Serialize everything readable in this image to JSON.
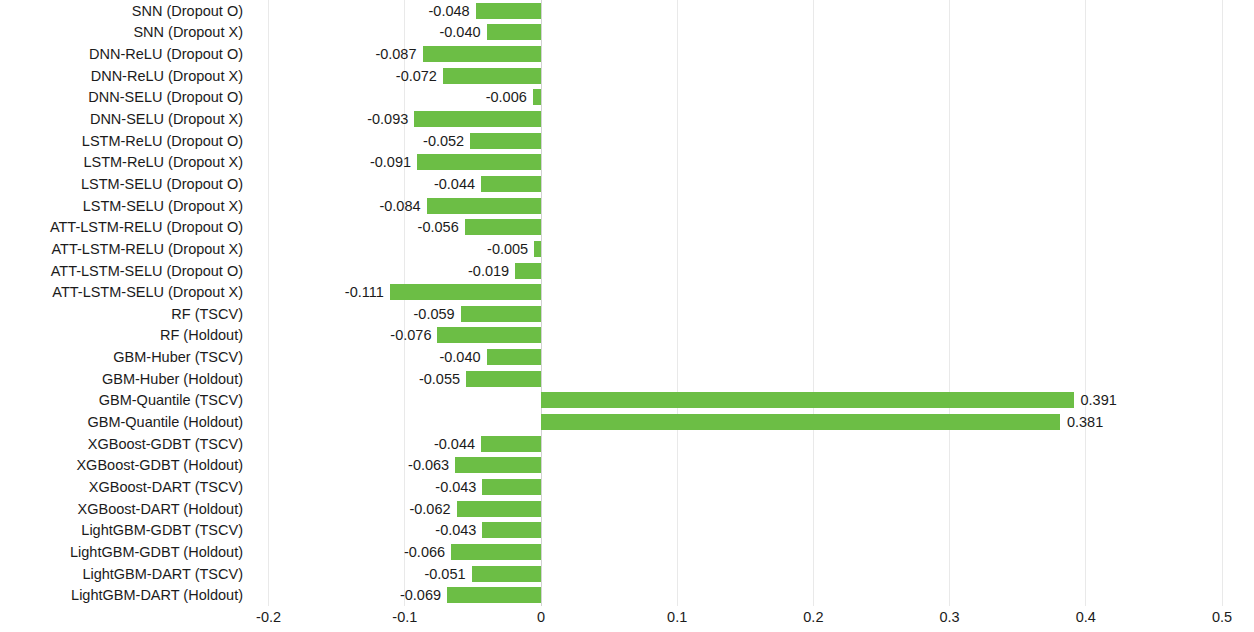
{
  "chart_data": {
    "type": "bar",
    "orientation": "horizontal",
    "title": "",
    "xlabel": "",
    "ylabel": "",
    "xlim": [
      -0.2,
      0.5
    ],
    "xticks": [
      "-0.2",
      "-0.1",
      "0",
      "0.1",
      "0.2",
      "0.3",
      "0.4",
      "0.5"
    ],
    "xtick_values": [
      -0.2,
      -0.1,
      0,
      0.1,
      0.2,
      0.3,
      0.4,
      0.5
    ],
    "grid": true,
    "legend": "none",
    "bar_color": "#6cbe45",
    "categories": [
      "SNN (Dropout O)",
      "SNN (Dropout X)",
      "DNN-ReLU (Dropout O)",
      "DNN-ReLU (Dropout X)",
      "DNN-SELU (Dropout O)",
      "DNN-SELU (Dropout X)",
      "LSTM-ReLU (Dropout O)",
      "LSTM-ReLU (Dropout X)",
      "LSTM-SELU (Dropout O)",
      "LSTM-SELU (Dropout X)",
      "ATT-LSTM-RELU (Dropout O)",
      "ATT-LSTM-RELU (Dropout X)",
      "ATT-LSTM-SELU (Dropout O)",
      "ATT-LSTM-SELU (Dropout X)",
      "RF (TSCV)",
      "RF (Holdout)",
      "GBM-Huber (TSCV)",
      "GBM-Huber (Holdout)",
      "GBM-Quantile (TSCV)",
      "GBM-Quantile (Holdout)",
      "XGBoost-GDBT (TSCV)",
      "XGBoost-GDBT (Holdout)",
      "XGBoost-DART (TSCV)",
      "XGBoost-DART (Holdout)",
      "LightGBM-GDBT (TSCV)",
      "LightGBM-GDBT (Holdout)",
      "LightGBM-DART (TSCV)",
      "LightGBM-DART (Holdout)"
    ],
    "values": [
      -0.048,
      -0.04,
      -0.087,
      -0.072,
      -0.006,
      -0.093,
      -0.052,
      -0.091,
      -0.044,
      -0.084,
      -0.056,
      -0.005,
      -0.019,
      -0.111,
      -0.059,
      -0.076,
      -0.04,
      -0.055,
      0.391,
      0.381,
      -0.044,
      -0.063,
      -0.043,
      -0.062,
      -0.043,
      -0.066,
      -0.051,
      -0.069
    ],
    "value_labels": [
      "-0.048",
      "-0.040",
      "-0.087",
      "-0.072",
      "-0.006",
      "-0.093",
      "-0.052",
      "-0.091",
      "-0.044",
      "-0.084",
      "-0.056",
      "-0.005",
      "-0.019",
      "-0.111",
      "-0.059",
      "-0.076",
      "-0.040",
      "-0.055",
      "0.391",
      "0.381",
      "-0.044",
      "-0.063",
      "-0.043",
      "-0.062",
      "-0.043",
      "-0.066",
      "-0.051",
      "-0.069"
    ]
  }
}
